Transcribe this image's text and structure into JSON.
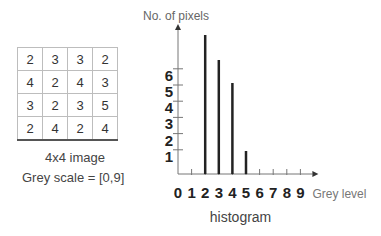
{
  "matrix": {
    "rows": [
      [
        "2",
        "3",
        "3",
        "2"
      ],
      [
        "4",
        "2",
        "4",
        "3"
      ],
      [
        "3",
        "2",
        "3",
        "5"
      ],
      [
        "2",
        "4",
        "2",
        "4"
      ]
    ],
    "caption": "4x4 image",
    "scale_label": "Grey scale = [0,9]"
  },
  "chart_data": {
    "type": "bar",
    "title": "histogram",
    "xlabel": "Grey level",
    "ylabel": "No. of pixels",
    "categories": [
      "0",
      "1",
      "2",
      "3",
      "4",
      "5",
      "6",
      "7",
      "8",
      "9"
    ],
    "values": [
      0,
      0,
      6,
      5,
      4,
      1,
      0,
      0,
      0,
      0
    ],
    "y_ticks": [
      "1",
      "2",
      "3",
      "4",
      "5",
      "6"
    ],
    "ylim": [
      0,
      6
    ],
    "grid": false,
    "legend": null
  }
}
